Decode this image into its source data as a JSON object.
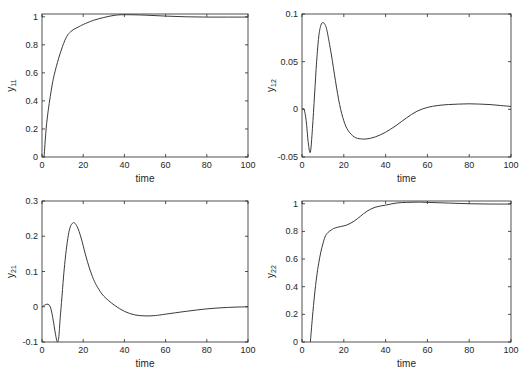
{
  "figure": {
    "background": "#ffffff",
    "axis_color": "#262626",
    "line_color": "#3a3a3a"
  },
  "chart_data": [
    {
      "type": "line",
      "id": "y11",
      "ylabel_main": "y",
      "ylabel_sub": "11",
      "xlabel": "time",
      "xlim": [
        0,
        100
      ],
      "ylim": [
        0,
        1.02
      ],
      "xticks": [
        0,
        20,
        40,
        60,
        80,
        100
      ],
      "yticks": [
        0,
        0.2,
        0.4,
        0.6,
        0.8,
        1
      ],
      "ytick_labels": [
        "0",
        "0.2",
        "0.4",
        "0.6",
        "0.8",
        "1"
      ],
      "box": {
        "x0": 42,
        "y0": 14,
        "x1": 248,
        "y1": 157
      },
      "x": [
        1,
        2,
        3,
        4,
        5,
        6,
        8,
        10,
        12,
        14,
        16,
        18,
        20,
        25,
        30,
        35,
        40,
        50,
        60,
        70,
        80,
        90,
        100
      ],
      "y": [
        0,
        0.2,
        0.33,
        0.43,
        0.52,
        0.59,
        0.7,
        0.79,
        0.86,
        0.895,
        0.915,
        0.93,
        0.945,
        0.975,
        0.995,
        1.01,
        1.015,
        1.012,
        1.005,
        1.0,
        0.998,
        0.998,
        0.998
      ]
    },
    {
      "type": "line",
      "id": "y12",
      "ylabel_main": "y",
      "ylabel_sub": "12",
      "xlabel": "time",
      "xlim": [
        0,
        100
      ],
      "ylim": [
        -0.05,
        0.1
      ],
      "xticks": [
        0,
        20,
        40,
        60,
        80,
        100
      ],
      "yticks": [
        -0.05,
        0,
        0.05,
        0.1
      ],
      "ytick_labels": [
        "-0.05",
        "0",
        "0.05",
        "0.1"
      ],
      "box": {
        "x0": 302,
        "y0": 14,
        "x1": 511,
        "y1": 157
      },
      "x": [
        0,
        1,
        2,
        3,
        4,
        5,
        6,
        7,
        8,
        9,
        10,
        11,
        12,
        14,
        16,
        18,
        20,
        22,
        25,
        28,
        31,
        35,
        40,
        45,
        50,
        55,
        60,
        65,
        70,
        75,
        80,
        85,
        90,
        95,
        100
      ],
      "y": [
        0,
        0,
        -0.012,
        -0.035,
        -0.045,
        -0.02,
        0.015,
        0.05,
        0.076,
        0.088,
        0.091,
        0.089,
        0.082,
        0.058,
        0.03,
        0.005,
        -0.012,
        -0.022,
        -0.029,
        -0.031,
        -0.031,
        -0.029,
        -0.024,
        -0.017,
        -0.009,
        -0.002,
        0.002,
        0.004,
        0.005,
        0.0055,
        0.0058,
        0.0055,
        0.005,
        0.004,
        0.003
      ]
    },
    {
      "type": "line",
      "id": "y21",
      "ylabel_main": "y",
      "ylabel_sub": "21",
      "xlabel": "time",
      "xlim": [
        0,
        100
      ],
      "ylim": [
        -0.1,
        0.3
      ],
      "xticks": [
        0,
        20,
        40,
        60,
        80,
        100
      ],
      "yticks": [
        -0.1,
        0,
        0.1,
        0.2,
        0.3
      ],
      "ytick_labels": [
        "-0.1",
        "0",
        "0.1",
        "0.2",
        "0.3"
      ],
      "box": {
        "x0": 42,
        "y0": 201,
        "x1": 248,
        "y1": 342
      },
      "x": [
        0,
        4,
        7.5,
        9,
        11,
        13,
        15,
        17,
        19,
        21,
        23,
        25,
        27,
        30,
        35,
        40,
        45,
        50,
        55,
        60,
        70,
        80,
        90,
        100
      ],
      "y": [
        0,
        0,
        -0.1,
        -0.02,
        0.12,
        0.21,
        0.238,
        0.228,
        0.195,
        0.15,
        0.11,
        0.078,
        0.055,
        0.03,
        0.005,
        -0.013,
        -0.023,
        -0.026,
        -0.025,
        -0.021,
        -0.013,
        -0.006,
        -0.002,
        0
      ]
    },
    {
      "type": "line",
      "id": "y22",
      "ylabel_main": "y",
      "ylabel_sub": "22",
      "xlabel": "time",
      "xlim": [
        0,
        100
      ],
      "ylim": [
        0,
        1.02
      ],
      "xticks": [
        0,
        20,
        40,
        60,
        80,
        100
      ],
      "yticks": [
        0,
        0.2,
        0.4,
        0.6,
        0.8,
        1
      ],
      "ytick_labels": [
        "0",
        "0.2",
        "0.4",
        "0.6",
        "0.8",
        "1"
      ],
      "box": {
        "x0": 302,
        "y0": 201,
        "x1": 511,
        "y1": 342
      },
      "x": [
        4,
        5,
        6,
        7,
        8,
        9,
        10,
        11,
        12,
        13,
        14,
        15,
        17,
        20,
        22,
        25,
        28,
        31,
        35,
        40,
        45,
        50,
        55,
        60,
        70,
        80,
        90,
        100
      ],
      "y": [
        0,
        0.18,
        0.34,
        0.47,
        0.57,
        0.65,
        0.71,
        0.76,
        0.785,
        0.8,
        0.81,
        0.82,
        0.83,
        0.84,
        0.85,
        0.875,
        0.91,
        0.945,
        0.975,
        0.99,
        1.005,
        1.01,
        1.012,
        1.01,
        1.005,
        1.0,
        0.998,
        0.998
      ]
    }
  ]
}
